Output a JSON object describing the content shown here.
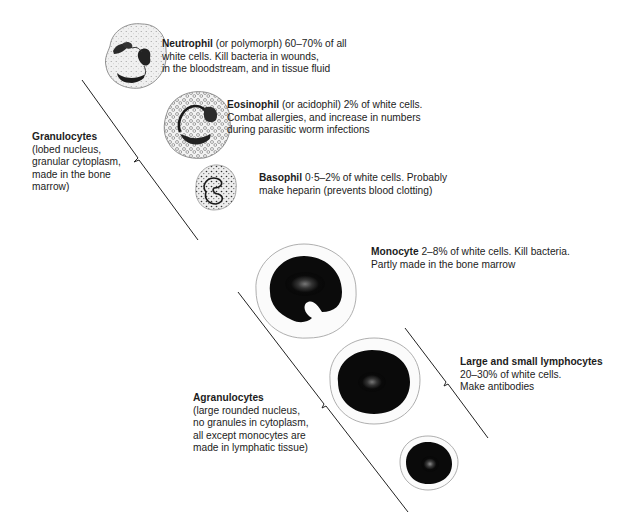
{
  "diagram": {
    "groups": [
      {
        "name": "Granulocytes",
        "description": [
          "(lobed nucleus,",
          "granular cytoplasm,",
          "made in the bone",
          "marrow)"
        ]
      },
      {
        "name": "Agranulocytes",
        "description": [
          "(large rounded nucleus,",
          "no granules in cytoplasm,",
          "all except monocytes are",
          "made in lymphatic tissue)"
        ]
      }
    ],
    "cells": [
      {
        "name": "Neutrophil",
        "lines": [
          "(or polymorph) 60–70% of all",
          "white cells. Kill bacteria in wounds,",
          "in the bloodstream, and in tissue fluid"
        ],
        "group": "Granulocytes"
      },
      {
        "name": "Eosinophil",
        "lines": [
          "(or acidophil) 2% of white cells.",
          "Combat allergies, and increase in numbers",
          "during parasitic worm infections"
        ],
        "group": "Granulocytes"
      },
      {
        "name": "Basophil",
        "lines": [
          "0·5–2% of white cells. Probably",
          "make heparin (prevents blood clotting)"
        ],
        "group": "Granulocytes"
      },
      {
        "name": "Monocyte",
        "lines": [
          "2–8% of white cells. Kill bacteria.",
          "Partly made in the bone marrow"
        ],
        "group": "Agranulocytes"
      },
      {
        "name": "Large and small lymphocytes",
        "lines": [
          "20–30% of white cells.",
          "Make antibodies"
        ],
        "group": "Agranulocytes"
      }
    ],
    "colors": {
      "ink": "#111111",
      "cell_fill": "#f2f2f2",
      "outline": "#9a9a9a",
      "line": "#222222"
    }
  }
}
